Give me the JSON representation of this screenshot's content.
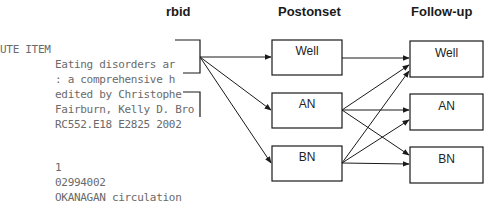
{
  "overlay_text": {
    "header": "UTE ITEM",
    "lines": [
      "Eating disorders ar",
      ": a comprehensive h",
      "edited by Christophe",
      "Fairburn, Kelly D. Bro",
      "RC552.E18 E2825 2002",
      "",
      "1",
      "02994002",
      "OKANAGAN circulation"
    ]
  },
  "diagram": {
    "columns": [
      {
        "heading": "rbid"
      },
      {
        "heading": "Postonset"
      },
      {
        "heading": "Follow-up"
      }
    ],
    "postonset_nodes": [
      "Well",
      "AN",
      "BN"
    ],
    "followup_nodes": [
      "Well",
      "AN",
      "BN"
    ],
    "colors": {
      "line": "#1a1a1a",
      "overlay_text": "#6a6a6a"
    }
  }
}
